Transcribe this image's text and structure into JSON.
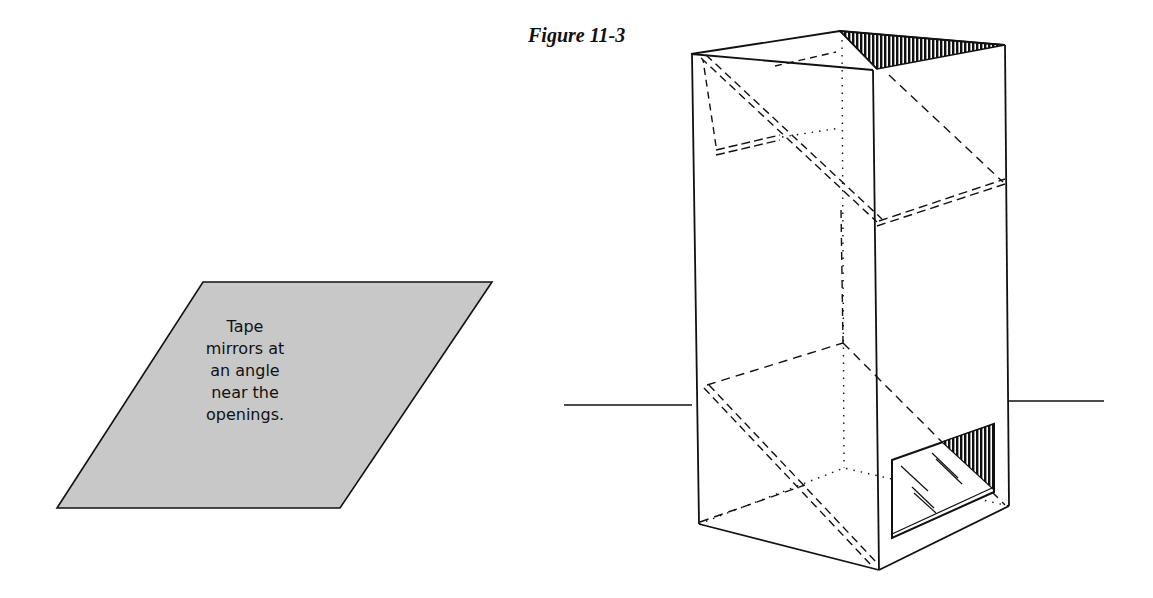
{
  "figure": {
    "title": "Figure 11-3",
    "callout": {
      "lines": [
        "Tape",
        "mirrors at",
        "an angle",
        "near the",
        "openings."
      ],
      "fill_color": "#c8c8c8"
    },
    "object": "periscope box with two angled mirrors (top and bottom openings)"
  }
}
